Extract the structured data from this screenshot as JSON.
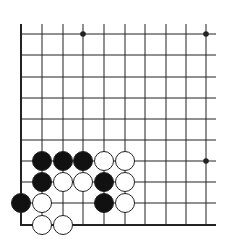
{
  "diagram": {
    "type": "go-board-fragment",
    "board": {
      "columns_x": [
        21,
        42,
        63,
        83,
        104,
        125,
        145,
        166,
        186,
        206
      ],
      "rows_y": [
        34,
        55,
        77,
        98,
        119,
        140,
        161,
        182,
        203,
        225
      ],
      "line_top": 24,
      "line_right": 216,
      "left_edge": true,
      "bottom_edge": true,
      "line_color": "#222222",
      "edge_width": 2,
      "line_width": 1
    },
    "star_points": [
      {
        "col": 3,
        "row": 0
      },
      {
        "col": 9,
        "row": 0
      },
      {
        "col": 9,
        "row": 6
      }
    ],
    "stones": [
      {
        "color": "black",
        "col": 1,
        "row": 6
      },
      {
        "color": "black",
        "col": 2,
        "row": 6
      },
      {
        "color": "black",
        "col": 3,
        "row": 6
      },
      {
        "color": "white",
        "col": 4,
        "row": 6
      },
      {
        "color": "white",
        "col": 5,
        "row": 6
      },
      {
        "color": "black",
        "col": 1,
        "row": 7
      },
      {
        "color": "white",
        "col": 2,
        "row": 7
      },
      {
        "color": "white",
        "col": 3,
        "row": 7
      },
      {
        "color": "black",
        "col": 4,
        "row": 7
      },
      {
        "color": "white",
        "col": 5,
        "row": 7
      },
      {
        "color": "black",
        "col": 0,
        "row": 8
      },
      {
        "color": "white",
        "col": 1,
        "row": 8
      },
      {
        "color": "black",
        "col": 4,
        "row": 8
      },
      {
        "color": "white",
        "col": 5,
        "row": 8
      },
      {
        "color": "white",
        "col": 1,
        "row": 9
      },
      {
        "color": "white",
        "col": 2,
        "row": 9
      }
    ],
    "stone_radius": 9.5,
    "colors": {
      "black": "#111111",
      "white": "#ffffff",
      "outline": "#222222"
    }
  }
}
